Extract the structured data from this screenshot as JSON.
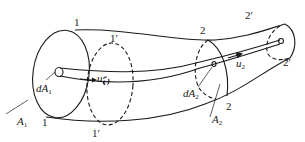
{
  "diagram": {
    "title": "",
    "sections": [
      {
        "id": "1",
        "label": "1",
        "label_bottom": "1",
        "area": "A",
        "area_sub": "1",
        "elem_area": "dA",
        "elem_sub": "1",
        "velocity": "u",
        "velocity_sub": "1"
      },
      {
        "id": "1p",
        "label": "1′",
        "label_bottom": "1′"
      },
      {
        "id": "2",
        "label": "2",
        "label_bottom": "2",
        "area": "A",
        "area_sub": "2",
        "elem_area": "dA",
        "elem_sub": "2",
        "velocity": "u",
        "velocity_sub": "2"
      },
      {
        "id": "2p",
        "label": "2′",
        "label_bottom": "2′"
      }
    ],
    "colors": {
      "line": "#1a1a1a",
      "background": "#ffffff"
    }
  }
}
